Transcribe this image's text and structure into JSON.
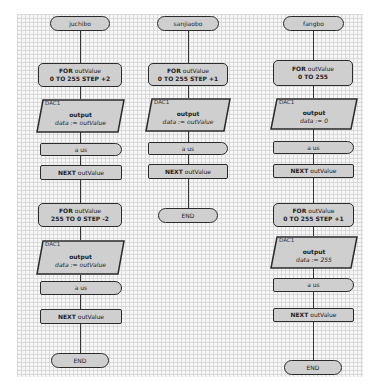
{
  "flowcharts": [
    {
      "name": "juchibo",
      "start_label": "juchibo",
      "loops": [
        {
          "for_keyword": "FOR",
          "for_var": "outValue",
          "for_range": "0 TO 255 STEP +2",
          "device": "DAC1",
          "output_title": "output",
          "output_expr": "data := outValue",
          "wait_label": "a us",
          "next_keyword": "NEXT",
          "next_var": "outValue"
        },
        {
          "for_keyword": "FOR",
          "for_var": "outValue",
          "for_range": "255 TO 0 STEP -2",
          "device": "DAC1",
          "output_title": "output",
          "output_expr": "data := outValue",
          "wait_label": "a us",
          "next_keyword": "NEXT",
          "next_var": "outValue"
        }
      ],
      "end_label": "END"
    },
    {
      "name": "sanjiaobo",
      "start_label": "sanjiaobo",
      "loops": [
        {
          "for_keyword": "FOR",
          "for_var": "outValue",
          "for_range": "0 TO 255 STEP +1",
          "device": "DAC1",
          "output_title": "output",
          "output_expr": "data := outValue",
          "wait_label": "a us",
          "next_keyword": "NEXT",
          "next_var": "outValue"
        }
      ],
      "end_label": "END"
    },
    {
      "name": "fangbo",
      "start_label": "fangbo",
      "loops": [
        {
          "for_keyword": "FOR",
          "for_var": "outValue",
          "for_range": "0 TO 255",
          "device": "DAC1",
          "output_title": "output",
          "output_expr": "data := 0",
          "wait_label": "a us",
          "next_keyword": "NEXT",
          "next_var": "outValue"
        },
        {
          "for_keyword": "FOR",
          "for_var": "outValue",
          "for_range": "0 TO 255 STEP +1",
          "device": "DAC1",
          "output_title": "output",
          "output_expr": "data := 255",
          "wait_label": "a us",
          "next_keyword": "NEXT",
          "next_var": "outValue"
        }
      ],
      "end_label": "END"
    }
  ],
  "colors": {
    "shape_fill": "#cfcfcf",
    "shape_stroke": "#2b2b2b",
    "grid_line": "#d9d9d9",
    "grid_bg": "#f7f7f7"
  }
}
